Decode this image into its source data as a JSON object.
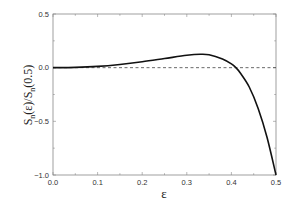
{
  "chart_data": {
    "type": "line",
    "title": "",
    "xlabel": "ε",
    "ylabel": "S_n(ε)/S_n(0.5)",
    "ylabel_parts": {
      "s1": "S",
      "sub1": "n",
      "mid": "(ε)/S",
      "sub2": "n",
      "end": "(0.5)"
    },
    "xlim": [
      0.0,
      0.5
    ],
    "ylim": [
      -1.0,
      0.5
    ],
    "xticks": [
      "0.0",
      "0.1",
      "0.2",
      "0.3",
      "0.4",
      "0.5"
    ],
    "yticks": [
      "0.5",
      "0.0",
      "-0.5",
      "-1.0"
    ],
    "grid": false,
    "legend": null,
    "reference_line": {
      "y": 0.0,
      "style": "dashed"
    },
    "series": [
      {
        "name": "S_n(ε)/S_n(0.5)",
        "x": [
          0.0,
          0.05,
          0.1,
          0.15,
          0.2,
          0.25,
          0.3,
          0.33,
          0.35,
          0.38,
          0.4,
          0.41,
          0.42,
          0.44,
          0.46,
          0.48,
          0.5
        ],
        "y": [
          0.0,
          0.003,
          0.012,
          0.03,
          0.055,
          0.085,
          0.115,
          0.125,
          0.12,
          0.08,
          0.035,
          0.0,
          -0.05,
          -0.18,
          -0.38,
          -0.65,
          -1.0
        ]
      }
    ]
  }
}
